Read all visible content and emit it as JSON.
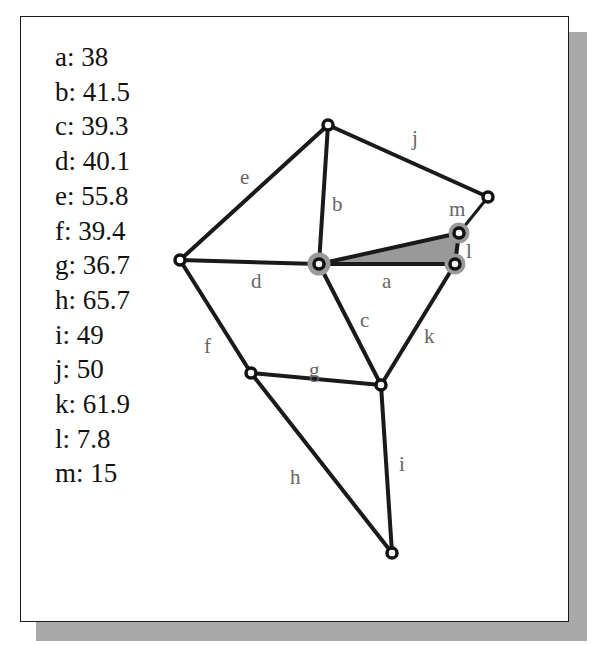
{
  "legend": [
    {
      "key": "a",
      "value": "38",
      "text": "a: 38"
    },
    {
      "key": "b",
      "value": "41.5",
      "text": "b: 41.5"
    },
    {
      "key": "c",
      "value": "39.3",
      "text": "c: 39.3"
    },
    {
      "key": "d",
      "value": "40.1",
      "text": "d: 40.1"
    },
    {
      "key": "e",
      "value": "55.8",
      "text": "e: 55.8"
    },
    {
      "key": "f",
      "value": "39.4",
      "text": "f: 39.4"
    },
    {
      "key": "g",
      "value": "36.7",
      "text": "g: 36.7"
    },
    {
      "key": "h",
      "value": "65.7",
      "text": "h: 65.7"
    },
    {
      "key": "i",
      "value": "49",
      "text": "i: 49"
    },
    {
      "key": "j",
      "value": "50",
      "text": "j: 50"
    },
    {
      "key": "k",
      "value": "61.9",
      "text": "k: 61.9"
    },
    {
      "key": "l",
      "value": "7.8",
      "text": "l: 7.8"
    },
    {
      "key": "m",
      "value": "15",
      "text": "m: 15"
    }
  ],
  "graph": {
    "nodes": {
      "left": [
        180,
        260
      ],
      "top": [
        328,
        125
      ],
      "center": [
        319,
        264
      ],
      "far_right": [
        488,
        197
      ],
      "l_top": [
        459,
        233
      ],
      "l_bottom": [
        455,
        264
      ],
      "lower_left": [
        251,
        373
      ],
      "lower_mid": [
        381,
        385
      ],
      "bottom": [
        392,
        553
      ]
    },
    "edges": [
      {
        "label": "a",
        "from": "center",
        "to": "l_bottom"
      },
      {
        "label": "b",
        "from": "top",
        "to": "center"
      },
      {
        "label": "c",
        "from": "center",
        "to": "lower_mid"
      },
      {
        "label": "d",
        "from": "left",
        "to": "center"
      },
      {
        "label": "e",
        "from": "left",
        "to": "top"
      },
      {
        "label": "f",
        "from": "left",
        "to": "lower_left"
      },
      {
        "label": "g",
        "from": "lower_left",
        "to": "lower_mid"
      },
      {
        "label": "h",
        "from": "lower_left",
        "to": "bottom"
      },
      {
        "label": "i",
        "from": "lower_mid",
        "to": "bottom"
      },
      {
        "label": "j",
        "from": "top",
        "to": "far_right"
      },
      {
        "label": "k",
        "from": "l_bottom",
        "to": "lower_mid"
      },
      {
        "label": "l",
        "from": "l_top",
        "to": "l_bottom"
      },
      {
        "label": "m",
        "from": "far_right",
        "to": "l_top"
      }
    ],
    "labels": {
      "a": "a",
      "b": "b",
      "c": "c",
      "d": "d",
      "e": "e",
      "f": "f",
      "g": "g",
      "h": "h",
      "i": "i",
      "j": "j",
      "k": "k",
      "l": "l",
      "m": "m"
    },
    "shaded_triangle": [
      "center",
      "l_top",
      "l_bottom"
    ],
    "colors": {
      "edge": "#1a1a1a",
      "label": "#666666",
      "triangle_fill": "#999999",
      "highlight_halo": "#9a9a9a",
      "shadow": "#a9a9a9"
    }
  }
}
